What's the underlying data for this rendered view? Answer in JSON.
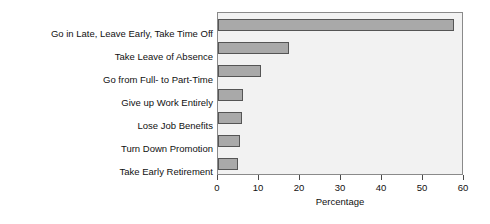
{
  "chart_data": {
    "type": "bar",
    "orientation": "horizontal",
    "title": "",
    "xlabel": "Percentage",
    "ylabel": "",
    "xlim": [
      0,
      60
    ],
    "xticks": [
      0,
      10,
      20,
      30,
      40,
      50,
      60
    ],
    "grid": false,
    "legend": null,
    "categories": [
      "Go in Late, Leave Early, Take Time Off",
      "Take Leave of Absence",
      "Go from Full- to Part-Time",
      "Give up Work Entirely",
      "Lose Job Benefits",
      "Turn Down Promotion",
      "Take Early Retirement"
    ],
    "values": [
      57.5,
      17.4,
      10.5,
      6.1,
      5.9,
      5.4,
      4.9
    ],
    "colors": {
      "bar_fill": "#a9a9a9",
      "bar_border": "#555555",
      "plot_background": "#f2f2f2",
      "frame": "#8a8a8a",
      "text": "#111111",
      "page_background": "#ffffff"
    }
  }
}
